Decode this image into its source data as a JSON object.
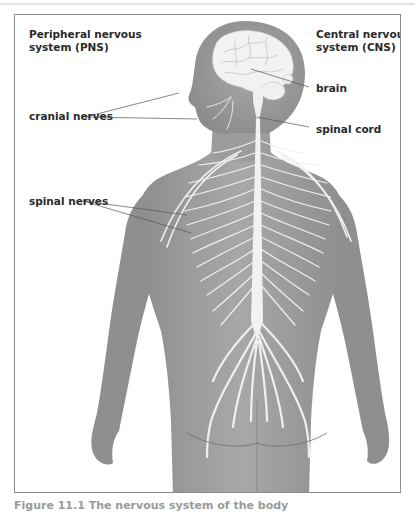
{
  "figure": {
    "labels": {
      "pns_title_line1": "Peripheral nervous",
      "pns_title_line2": "system (PNS)",
      "cns_title_line1": "Central nervous",
      "cns_title_line2": "system (CNS)",
      "brain": "brain",
      "spinal_cord": "spinal cord",
      "cranial_nerves": "cranial nerves",
      "spinal_nerves": "spinal nerves"
    },
    "caption": "Figure 11.1   The nervous system of the body",
    "colors": {
      "body_fill": "#9a9a9a",
      "body_dark": "#7f7f7f",
      "nerve": "#f2f2f2",
      "border": "#8a8a8a",
      "leader_line": "#555555"
    }
  }
}
